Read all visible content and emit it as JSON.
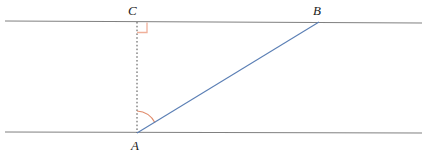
{
  "figure": {
    "background_color": "#ffffff",
    "width": 428,
    "height": 157,
    "labels": {
      "A": "A",
      "B": "B",
      "C": "C"
    },
    "colors": {
      "line_gray": "#808080",
      "dashed_gray": "#4d4d4d",
      "transversal_blue": "#5b7fb5",
      "marker_salmon": "#e08a6a",
      "right_angle_salmon": "#f0b09a",
      "label_color": "#1a1a1a"
    },
    "points": {
      "A": {
        "x": 137,
        "y": 133
      },
      "B": {
        "x": 319,
        "y": 22
      },
      "C": {
        "x": 137,
        "y": 22
      }
    },
    "segments": {
      "top_parallel_line": {
        "x1": 5,
        "y1": 21,
        "x2": 422,
        "y2": 23,
        "style": "solid",
        "color": "#808080"
      },
      "bottom_parallel_line": {
        "x1": 5,
        "y1": 132,
        "x2": 422,
        "y2": 133,
        "style": "solid",
        "color": "#808080"
      },
      "altitude_CA": {
        "x1": 137,
        "y1": 22,
        "x2": 137,
        "y2": 133,
        "style": "dashed",
        "color": "#4d4d4d"
      },
      "transversal_AB": {
        "x1": 137,
        "y1": 133,
        "x2": 319,
        "y2": 22,
        "style": "solid",
        "color": "#5b7fb5"
      }
    },
    "markers": {
      "right_angle_at_C": {
        "size": 10,
        "color": "#f0b09a"
      },
      "angle_arc_at_A": {
        "radius": 22,
        "color": "#e08a6a"
      }
    }
  }
}
